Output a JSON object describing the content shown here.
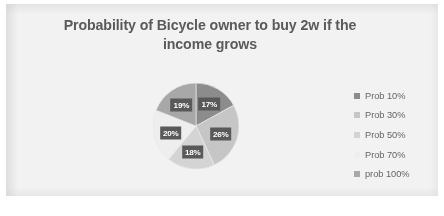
{
  "chart_data": {
    "type": "pie",
    "title": "Probability of Bicycle owner to buy 2w if the income grows",
    "title_line1": "Probability of Bicycle owner to buy 2w if the",
    "title_line2": "income grows",
    "xlabel": "",
    "ylabel": "",
    "grid": false,
    "legend_position": "right",
    "categories": [
      "Prob 10%",
      "Prob 30%",
      "Prob 50%",
      "Prob 70%",
      "prob 100%"
    ],
    "values": [
      17,
      26,
      18,
      20,
      19
    ],
    "value_labels": [
      "17%",
      "26%",
      "18%",
      "20%",
      "19%"
    ],
    "units": "percent",
    "slice_colors": [
      "#8c8c8c",
      "#c6c6c6",
      "#d4d4d4",
      "#eeeeee",
      "#a8a8a8"
    ],
    "data_label_background": "#595959",
    "data_label_color": "#ffffff",
    "slices": [
      {
        "label": "Prob 10%",
        "value": 17,
        "value_label": "17%",
        "color": "#8c8c8c"
      },
      {
        "label": "Prob 30%",
        "value": 26,
        "value_label": "26%",
        "color": "#c6c6c6"
      },
      {
        "label": "Prob 50%",
        "value": 18,
        "value_label": "18%",
        "color": "#d4d4d4"
      },
      {
        "label": "Prob 70%",
        "value": 20,
        "value_label": "20%",
        "color": "#eeeeee"
      },
      {
        "label": "prob 100%",
        "value": 19,
        "value_label": "19%",
        "color": "#a8a8a8"
      }
    ]
  },
  "legend": {
    "items": [
      {
        "label": "Prob 10%",
        "color": "#8c8c8c"
      },
      {
        "label": "Prob 30%",
        "color": "#c6c6c6"
      },
      {
        "label": "Prob 50%",
        "color": "#d4d4d4"
      },
      {
        "label": "Prob 70%",
        "color": "#eeeeee"
      },
      {
        "label": "prob 100%",
        "color": "#a8a8a8"
      }
    ]
  },
  "style": {
    "plot_background": "#f2f2f2",
    "page_background": "#ffffff",
    "title_color": "#5a5a5a",
    "legend_text_color": "#666666"
  }
}
